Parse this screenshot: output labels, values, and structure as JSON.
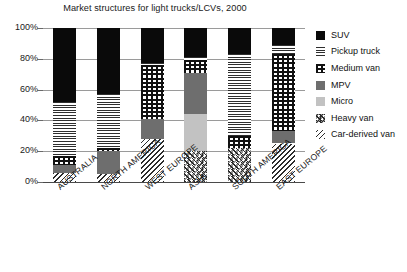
{
  "chart_data": {
    "type": "bar",
    "subtype": "stacked-bar-100-percent",
    "title": "Market structures for light trucks/LCVs, 2000",
    "xlabel": "",
    "ylabel": "",
    "ylim": [
      0,
      100
    ],
    "yticks": [
      0,
      20,
      40,
      60,
      80,
      100
    ],
    "ytick_labels": [
      "0%",
      "20%",
      "40%",
      "60%",
      "80%",
      "100%"
    ],
    "grid": true,
    "legend_position": "right",
    "units": "percent",
    "categories": [
      "AUSTRALIA",
      "NORTH AMERICA",
      "WEST EUROPE",
      "ASIA",
      "SOUTH AMERICA",
      "EAST EUROPE"
    ],
    "series": [
      {
        "name": "Car-derived van",
        "pattern": "diagonal-stripes",
        "values": [
          6,
          5,
          28,
          0,
          0,
          25
        ]
      },
      {
        "name": "Heavy van",
        "pattern": "chevron-hatch",
        "values": [
          0,
          0,
          0,
          20,
          22,
          0
        ]
      },
      {
        "name": "Micro",
        "pattern": "light-grey-solid",
        "values": [
          0,
          0,
          0,
          24,
          0,
          0
        ]
      },
      {
        "name": "MPV",
        "pattern": "grey-solid",
        "values": [
          5,
          15,
          13,
          27,
          0,
          8
        ]
      },
      {
        "name": "Medium van",
        "pattern": "checkerboard",
        "values": [
          6,
          2,
          35,
          8,
          8,
          50
        ]
      },
      {
        "name": "Pickup truck",
        "pattern": "horizontal-lines",
        "values": [
          35,
          35,
          1,
          2,
          53,
          6
        ]
      },
      {
        "name": "SUV",
        "pattern": "black-solid",
        "values": [
          48,
          43,
          23,
          19,
          17,
          11
        ]
      }
    ],
    "stack_tops": {
      "AUSTRALIA": {
        "car_derived_van": 6,
        "mpv": 11,
        "medium_van": 17,
        "pickup_truck": 52,
        "suv": 100
      },
      "NORTH AMERICA": {
        "car_derived_van": 5,
        "mpv": 20,
        "medium_van": 22,
        "pickup_truck": 57,
        "suv": 100
      },
      "WEST EUROPE": {
        "car_derived_van": 28,
        "mpv": 41,
        "medium_van": 76,
        "pickup_truck": 77,
        "suv": 100
      },
      "ASIA": {
        "heavy_van": 20,
        "micro": 44,
        "mpv": 71,
        "medium_van": 79,
        "pickup_truck": 81,
        "suv": 100
      },
      "SOUTH AMERICA": {
        "heavy_van": 22,
        "medium_van": 30,
        "pickup_truck": 83,
        "suv": 100
      },
      "EAST EUROPE": {
        "car_derived_van": 25,
        "mpv": 33,
        "medium_van": 83,
        "pickup_truck": 89,
        "suv": 100
      }
    }
  },
  "legend": {
    "items": [
      {
        "label": "SUV",
        "swatch": "legend-swatch-suv"
      },
      {
        "label": "Pickup truck",
        "swatch": "legend-swatch-pickup-truck"
      },
      {
        "label": "Medium van",
        "swatch": "legend-swatch-medium-van"
      },
      {
        "label": "MPV",
        "swatch": "legend-swatch-mpv"
      },
      {
        "label": "Micro",
        "swatch": "legend-swatch-micro"
      },
      {
        "label": "Heavy van",
        "swatch": "legend-swatch-heavy-van"
      },
      {
        "label": "Car-derived van",
        "swatch": "legend-swatch-car-derived-van"
      }
    ]
  },
  "colors": {
    "suv": "#0a0a0a",
    "mpv": "#6e6e6e",
    "micro": "#c2c2c2",
    "gridline": "#9a9a9a",
    "axis": "#4a4a4a",
    "text": "#1a1a1a",
    "background": "#ffffff"
  }
}
